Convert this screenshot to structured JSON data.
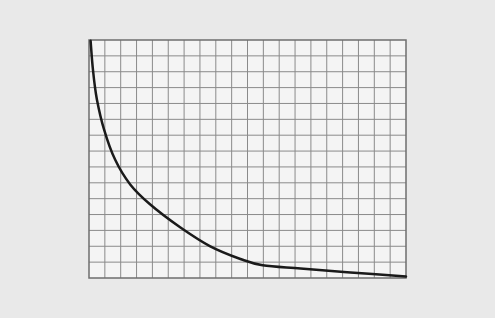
{
  "chart_data": {
    "type": "line",
    "title": "",
    "xlabel": "",
    "ylabel": "",
    "grid": true,
    "grid_columns": 20,
    "grid_rows": 15,
    "xlim": [
      0,
      20
    ],
    "ylim": [
      0,
      15
    ],
    "legend": null,
    "series": [
      {
        "name": "curve",
        "color": "#1a1a1a",
        "x": [
          0.1,
          0.25,
          0.5,
          0.95,
          1.65,
          2.6,
          3.85,
          5.75,
          7.65,
          9.55,
          10.95,
          13.35,
          16.5,
          20.0
        ],
        "y": [
          14.95,
          13.1,
          11.25,
          9.35,
          7.45,
          5.9,
          4.65,
          3.2,
          2.0,
          1.2,
          0.8,
          0.6,
          0.35,
          0.1
        ]
      }
    ]
  },
  "colors": {
    "background": "#e9e9e9",
    "plot_background": "#f4f4f4",
    "grid_line": "#8a8a8a",
    "border": "#6e6e6e",
    "curve": "#1a1a1a"
  }
}
